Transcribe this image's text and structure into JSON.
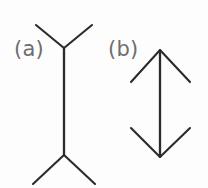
{
  "figure": {
    "background_color": "#fdfdfd",
    "line_color": "#2b2b2b",
    "label_color": "#6e6e6e",
    "width": 208,
    "height": 188,
    "panels": [
      {
        "id": "a",
        "label": "(a)",
        "label_x": 14,
        "label_y": 56,
        "description": "vertical shaft with outward-pointing fins (Y shapes) at both ends",
        "fin_direction": "outward",
        "shaft": {
          "x": 64,
          "y_top": 48,
          "y_bottom": 155,
          "length": 107
        },
        "fins": [
          {
            "name": "top-left-fin",
            "x1": 36,
            "y1": 25,
            "x2": 64,
            "y2": 48
          },
          {
            "name": "top-right-fin",
            "x1": 92,
            "y1": 25,
            "x2": 64,
            "y2": 48
          },
          {
            "name": "bottom-left-fin",
            "x1": 33,
            "y1": 184,
            "x2": 64,
            "y2": 155
          },
          {
            "name": "bottom-right-fin",
            "x1": 95,
            "y1": 184,
            "x2": 64,
            "y2": 155
          }
        ]
      },
      {
        "id": "b",
        "label": "(b)",
        "label_x": 108,
        "label_y": 56,
        "description": "vertical shaft with inward-pointing arrowheads at both ends",
        "fin_direction": "inward",
        "shaft": {
          "x": 160,
          "y_top": 50,
          "y_bottom": 157,
          "length": 107
        },
        "fins": [
          {
            "name": "top-left-arrowhead",
            "x1": 131,
            "y1": 82,
            "x2": 160,
            "y2": 50
          },
          {
            "name": "top-right-arrowhead",
            "x1": 190,
            "y1": 82,
            "x2": 160,
            "y2": 50
          },
          {
            "name": "bottom-left-arrowhead",
            "x1": 131,
            "y1": 128,
            "x2": 160,
            "y2": 157
          },
          {
            "name": "bottom-right-arrowhead",
            "x1": 190,
            "y1": 128,
            "x2": 160,
            "y2": 157
          }
        ]
      }
    ]
  }
}
